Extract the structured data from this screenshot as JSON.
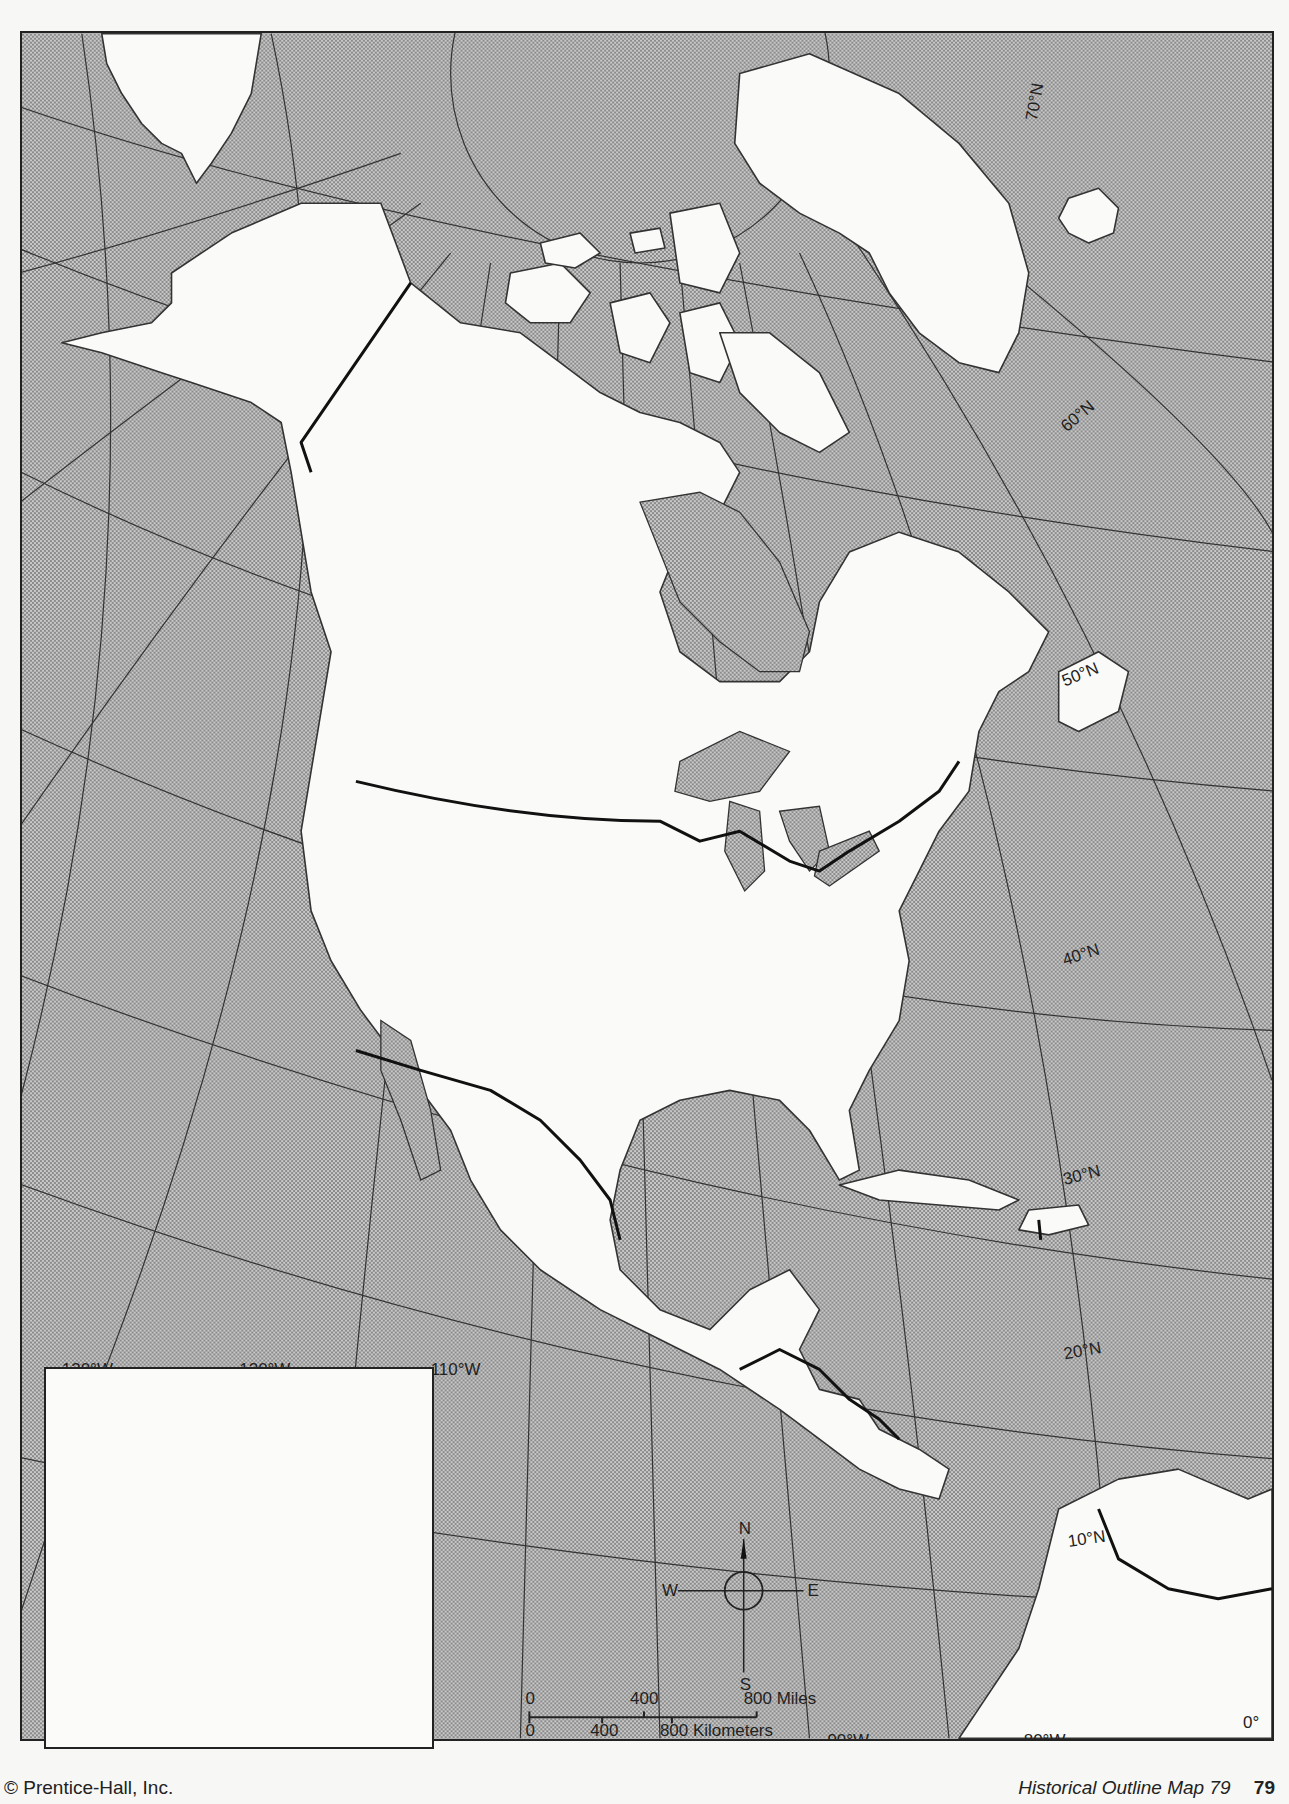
{
  "map": {
    "title": "Historical Outline Map 79",
    "page_number": "79",
    "copyright": "© Prentice-Hall, Inc.",
    "colors": {
      "ocean_pattern": "#b4b4b4",
      "land": "#fafaf8",
      "outline": "#333333",
      "border": "#111111"
    },
    "latitude_labels": [
      {
        "text": "70°N"
      },
      {
        "text": "60°N"
      },
      {
        "text": "50°N"
      },
      {
        "text": "40°N"
      },
      {
        "text": "30°N"
      },
      {
        "text": "20°N"
      },
      {
        "text": "10°N"
      },
      {
        "text": "0°"
      }
    ],
    "longitude_labels": [
      {
        "text": "130°W"
      },
      {
        "text": "120°W"
      },
      {
        "text": "110°W"
      },
      {
        "text": "90°W"
      },
      {
        "text": "80°W"
      }
    ],
    "compass": {
      "n": "N",
      "s": "S",
      "e": "E",
      "w": "W"
    },
    "scale_bar": {
      "miles_ticks": [
        "0",
        "400",
        "800 Miles"
      ],
      "km_ticks": [
        "0",
        "400",
        "800 Kilometers"
      ]
    },
    "inset_box": {
      "content": ""
    }
  }
}
